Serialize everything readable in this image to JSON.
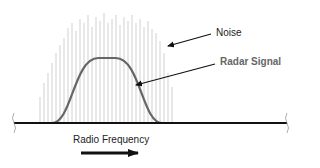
{
  "diagram": {
    "labels": {
      "noise": "Noise",
      "radar_signal": "Radar Signal",
      "axis": "Radio Frequency"
    },
    "colors": {
      "noise_lines": "#cccccc",
      "signal_curve": "#666666",
      "baseline": "#111111",
      "arrows": "#111111",
      "signal_label": "#666666",
      "text": "#222222"
    },
    "noise": {
      "x_start": 40,
      "x_end": 174,
      "spacing": 4,
      "baseline_y": 123,
      "heights": [
        26,
        40,
        50,
        60,
        70,
        78,
        85,
        95,
        100,
        92,
        104,
        100,
        108,
        96,
        106,
        102,
        110,
        100,
        104,
        108,
        98,
        106,
        102,
        108,
        100,
        104,
        96,
        102,
        94,
        90,
        82,
        70,
        50,
        36
      ]
    },
    "signal": {
      "start_x": 52,
      "end_x": 162,
      "peak_y": 58,
      "baseline_y": 123
    },
    "arrows": {
      "noise": {
        "x1": 211,
        "y1": 34,
        "x2": 168,
        "y2": 46
      },
      "signal": {
        "x1": 215,
        "y1": 64,
        "x2": 136,
        "y2": 85
      },
      "frequency": {
        "x1": 81,
        "y1": 153,
        "x2": 138,
        "y2": 153
      }
    }
  }
}
